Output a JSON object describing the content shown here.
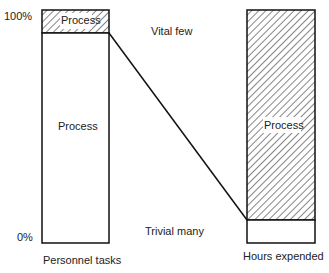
{
  "diagram": {
    "type": "pareto-comparison",
    "y_axis": {
      "top_label": "100%",
      "bottom_label": "0%"
    },
    "left_bar": {
      "label": "Personnel tasks",
      "segments": [
        {
          "name": "Process",
          "fraction": 0.9,
          "hatched": false
        },
        {
          "name": "Process",
          "fraction": 0.1,
          "hatched": true
        }
      ]
    },
    "right_bar": {
      "label": "Hours expended",
      "segments": [
        {
          "name": "",
          "fraction": 0.1,
          "hatched": false
        },
        {
          "name": "Process",
          "fraction": 0.9,
          "hatched": true
        }
      ]
    },
    "annotations": {
      "top": "Vital few",
      "bottom": "Trivial many"
    }
  }
}
